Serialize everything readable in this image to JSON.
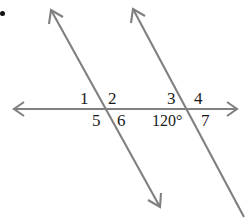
{
  "figure": {
    "width": 245,
    "height": 224,
    "background_color": "#ffffff",
    "line_color": "#808080",
    "label_color": "#1a1a1a"
  },
  "lines": {
    "horizontal_transversal": {
      "name": "horizontal-line",
      "x1": 13,
      "y1": 109,
      "x2": 237,
      "y2": 109,
      "arrow_start": true,
      "arrow_end": true
    },
    "parallel_left": {
      "name": "parallel-line-left",
      "x1": 51,
      "y1": 10,
      "x2": 160,
      "y2": 207,
      "arrow_start": true,
      "arrow_end": true
    },
    "parallel_right": {
      "name": "parallel-line-right",
      "x1": 133,
      "y1": 9,
      "x2": 243,
      "y2": 216,
      "arrow_start": true,
      "arrow_end": false
    }
  },
  "intersections": [
    {
      "name": "left-intersection",
      "x": 104,
      "y": 109
    },
    {
      "name": "right-intersection",
      "x": 190,
      "y": 109
    }
  ],
  "angle_labels": [
    {
      "id": "1",
      "text": "1",
      "x": 80,
      "y": 90,
      "position": "upper-left-of-left-intersection"
    },
    {
      "id": "2",
      "text": "2",
      "x": 108,
      "y": 90,
      "position": "upper-right-of-left-intersection"
    },
    {
      "id": "5",
      "text": "5",
      "x": 92,
      "y": 112,
      "position": "lower-left-of-left-intersection"
    },
    {
      "id": "6",
      "text": "6",
      "x": 117,
      "y": 112,
      "position": "lower-right-of-left-intersection"
    },
    {
      "id": "3",
      "text": "3",
      "x": 167,
      "y": 90,
      "position": "upper-left-of-right-intersection"
    },
    {
      "id": "4",
      "text": "4",
      "x": 194,
      "y": 90,
      "position": "upper-right-of-right-intersection"
    },
    {
      "id": "120",
      "text": "120°",
      "x": 152,
      "y": 112,
      "position": "lower-left-of-right-intersection",
      "wide": true
    },
    {
      "id": "7",
      "text": "7",
      "x": 201,
      "y": 112,
      "position": "lower-right-of-right-intersection"
    }
  ],
  "marker_dot": {
    "name": "corner-dot",
    "x": 0,
    "y": 11,
    "size": 5,
    "color": "#111111"
  }
}
